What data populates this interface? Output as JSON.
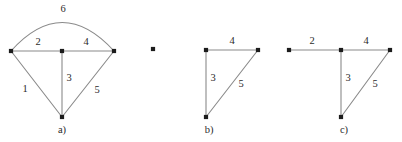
{
  "figure": {
    "background_color": "#ffffff",
    "edge_color": "#8a8a8a",
    "vertex_color": "#1c1c1c",
    "label_color": "#2b2b2b",
    "panels": [
      {
        "id": "a",
        "caption": "a)",
        "caption_pos": [
          62,
          131
        ],
        "vertices": [
          {
            "name": "vertex-a-left",
            "x": 11,
            "y": 51
          },
          {
            "name": "vertex-a-middle",
            "x": 62,
            "y": 51
          },
          {
            "name": "vertex-a-right",
            "x": 114,
            "y": 51
          },
          {
            "name": "vertex-a-bottom",
            "x": 62,
            "y": 117
          }
        ],
        "edges": [
          {
            "name": "edge-a-1",
            "weight": "1",
            "shape": "line",
            "from": [
              11,
              51
            ],
            "to": [
              62,
              117
            ],
            "label_pos": [
              25,
              90
            ]
          },
          {
            "name": "edge-a-2",
            "weight": "2",
            "shape": "line",
            "from": [
              11,
              51
            ],
            "to": [
              62,
              51
            ],
            "label_pos": [
              38,
              43
            ]
          },
          {
            "name": "edge-a-3",
            "weight": "3",
            "shape": "line",
            "from": [
              62,
              51
            ],
            "to": [
              62,
              117
            ],
            "label_pos": [
              69,
              79
            ]
          },
          {
            "name": "edge-a-4",
            "weight": "4",
            "shape": "line",
            "from": [
              62,
              51
            ],
            "to": [
              114,
              51
            ],
            "label_pos": [
              86,
              43
            ]
          },
          {
            "name": "edge-a-5",
            "weight": "5",
            "shape": "line",
            "from": [
              114,
              51
            ],
            "to": [
              62,
              117
            ],
            "label_pos": [
              97,
              91
            ]
          },
          {
            "name": "edge-a-6",
            "weight": "6",
            "shape": "arc",
            "from": [
              11,
              51
            ],
            "to": [
              114,
              51
            ],
            "control": [
              62,
              -6
            ],
            "label_pos": [
              63,
              10
            ]
          }
        ]
      },
      {
        "id": "b",
        "caption": "b)",
        "caption_pos": [
          209,
          131
        ],
        "vertices": [
          {
            "name": "vertex-b-isolated",
            "x": 153,
            "y": 49
          },
          {
            "name": "vertex-b-topleft",
            "x": 206,
            "y": 50
          },
          {
            "name": "vertex-b-topright",
            "x": 258,
            "y": 50
          },
          {
            "name": "vertex-b-bottom",
            "x": 206,
            "y": 117
          }
        ],
        "edges": [
          {
            "name": "edge-b-3",
            "weight": "3",
            "shape": "line",
            "from": [
              206,
              50
            ],
            "to": [
              206,
              117
            ],
            "label_pos": [
              213,
              79
            ]
          },
          {
            "name": "edge-b-4",
            "weight": "4",
            "shape": "line",
            "from": [
              206,
              50
            ],
            "to": [
              258,
              50
            ],
            "label_pos": [
              232,
              42
            ]
          },
          {
            "name": "edge-b-5",
            "weight": "5",
            "shape": "line",
            "from": [
              258,
              50
            ],
            "to": [
              206,
              117
            ],
            "label_pos": [
              241,
              85
            ]
          }
        ]
      },
      {
        "id": "c",
        "caption": "c)",
        "caption_pos": [
          344,
          131
        ],
        "vertices": [
          {
            "name": "vertex-c-left",
            "x": 289,
            "y": 50
          },
          {
            "name": "vertex-c-middle",
            "x": 341,
            "y": 50
          },
          {
            "name": "vertex-c-right",
            "x": 390,
            "y": 50
          },
          {
            "name": "vertex-c-bottom",
            "x": 341,
            "y": 117
          }
        ],
        "edges": [
          {
            "name": "edge-c-2",
            "weight": "2",
            "shape": "line",
            "from": [
              289,
              50
            ],
            "to": [
              341,
              50
            ],
            "label_pos": [
              312,
              42
            ]
          },
          {
            "name": "edge-c-3",
            "weight": "3",
            "shape": "line",
            "from": [
              341,
              50
            ],
            "to": [
              341,
              117
            ],
            "label_pos": [
              348,
              79
            ]
          },
          {
            "name": "edge-c-4",
            "weight": "4",
            "shape": "line",
            "from": [
              341,
              50
            ],
            "to": [
              390,
              50
            ],
            "label_pos": [
              366,
              42
            ]
          },
          {
            "name": "edge-c-5",
            "weight": "5",
            "shape": "line",
            "from": [
              390,
              50
            ],
            "to": [
              341,
              117
            ],
            "label_pos": [
              375,
              85
            ]
          }
        ]
      }
    ]
  }
}
